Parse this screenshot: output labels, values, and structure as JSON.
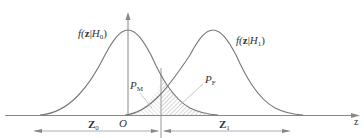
{
  "diagram": {
    "type": "two overlapping gaussian distributions with decision threshold",
    "curves": [
      {
        "id": "H0",
        "label_f": "f(",
        "label_z": "z",
        "label_mid": "|",
        "label_H": "H",
        "label_sub": "0",
        "label_close": ")",
        "peak_x": 128
      },
      {
        "id": "H1",
        "label_f": "f(",
        "label_z": "z",
        "label_mid": "|",
        "label_H": "H",
        "label_sub": "1",
        "label_close": ")",
        "peak_x": 213
      }
    ],
    "regions": {
      "miss": {
        "label_P": "P",
        "label_sub": "M"
      },
      "false_alarm": {
        "label_P": "P",
        "label_sub": "F"
      }
    },
    "axis": {
      "label": "z",
      "origin_label": "O"
    },
    "decision_regions": [
      {
        "label": "Z",
        "sub": "0"
      },
      {
        "label": "Z",
        "sub": "1"
      }
    ],
    "colors": {
      "line": "#777777",
      "text": "#333333",
      "hatch": "#999999"
    }
  }
}
